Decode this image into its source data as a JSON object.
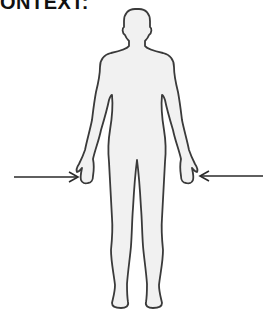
{
  "header": {
    "title": "CONTEXT:"
  },
  "figure": {
    "fill_color": "#f1f1f1",
    "stroke_color": "#3a3a3a",
    "arrows": [
      {
        "name": "left-hand-arrow",
        "target": "left-hand",
        "direction": "right"
      },
      {
        "name": "right-hand-arrow",
        "target": "right-hand",
        "direction": "left"
      }
    ]
  }
}
